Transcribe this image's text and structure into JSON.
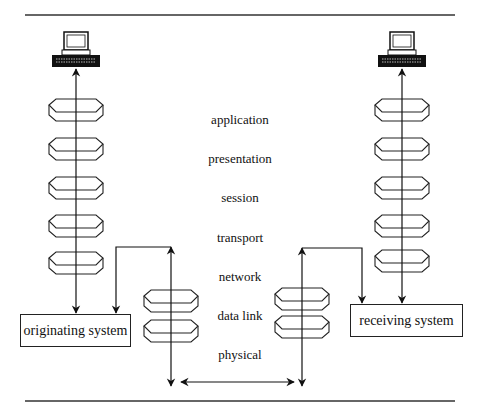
{
  "diagram": {
    "layers": [
      {
        "label": "application",
        "y": 120
      },
      {
        "label": "presentation",
        "y": 160
      },
      {
        "label": "session",
        "y": 199
      },
      {
        "label": "transport",
        "y": 239
      },
      {
        "label": "network",
        "y": 278
      },
      {
        "label": "data link",
        "y": 317
      },
      {
        "label": "physical",
        "y": 356
      }
    ],
    "originating_box": {
      "label": "originating system"
    },
    "receiving_box": {
      "label": "receiving system"
    },
    "colors": {
      "line": "#111111",
      "background": "#ffffff"
    }
  }
}
